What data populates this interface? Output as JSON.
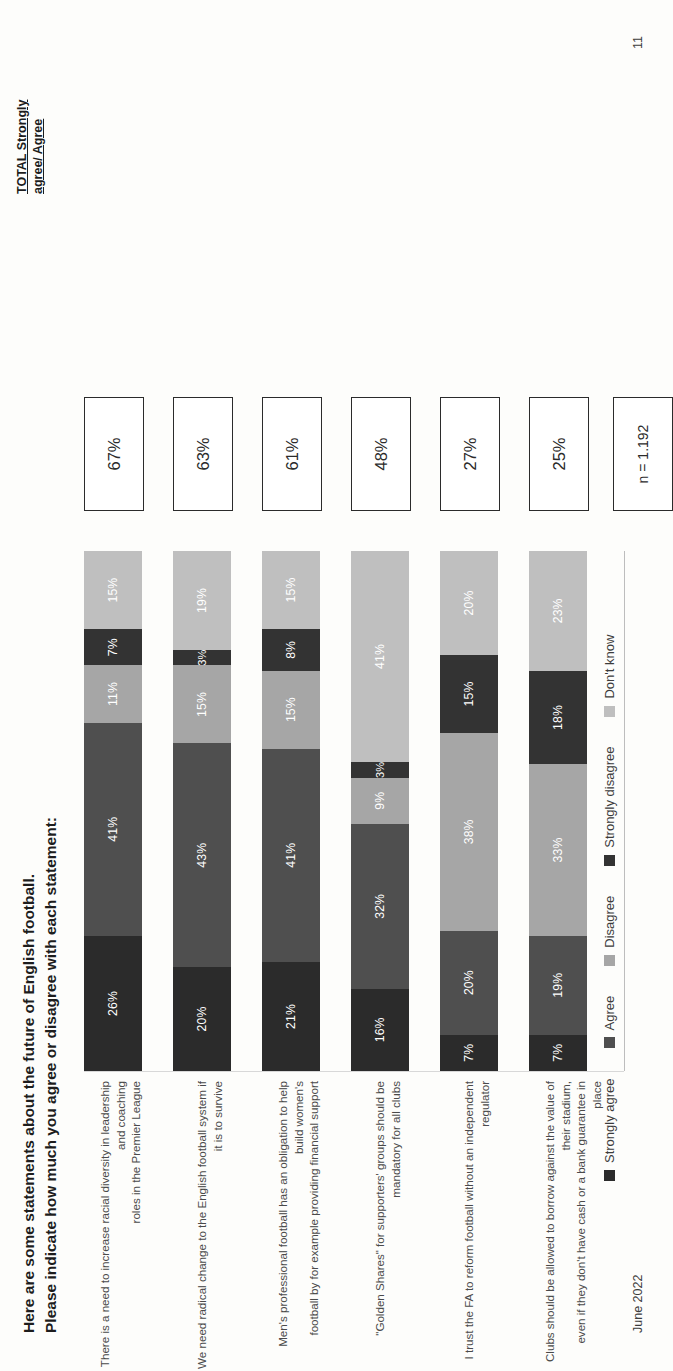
{
  "title": {
    "line1": "Here are some statements about the future of English football.",
    "line2": "Please indicate how much you agree or disagree with each statement:"
  },
  "total_header": {
    "line1": "TOTAL Strongly",
    "line2": "agree/ Agree"
  },
  "sample": {
    "label": "n = 1.192"
  },
  "footer": {
    "date": "June 2022",
    "page": "11"
  },
  "colors": {
    "strongly_agree": "#2b2b2b",
    "agree": "#4f4f4f",
    "disagree": "#a6a6a6",
    "strongly_disagree": "#333333",
    "dont_know": "#bfbfbf",
    "box_border": "#2b2b2b"
  },
  "legend": {
    "items": [
      {
        "label": "Strongly agree",
        "color": "#2b2b2b"
      },
      {
        "label": "Agree",
        "color": "#4f4f4f"
      },
      {
        "label": "Disagree",
        "color": "#a6a6a6"
      },
      {
        "label": "Strongly disagree",
        "color": "#333333"
      },
      {
        "label": "Don't know",
        "color": "#bfbfbf"
      }
    ]
  },
  "chart_data": {
    "type": "bar",
    "subtype": "stacked-horizontal-100",
    "title": "Here are some statements about the future of English football. Please indicate how much you agree or disagree with each statement:",
    "xlabel": "",
    "ylabel": "",
    "xlim": [
      0,
      100
    ],
    "grid": false,
    "legend_position": "bottom",
    "value_suffix": "%",
    "categories": [
      "There is a need to increase racial diversity in leadership and coaching roles in the Premier League",
      "We need radical change to the English football system if it is to survive",
      "Men's professional football has an obligation to help build women's football by for example providing financial support",
      "\"Golden Shares\" for supporters' groups should be mandatory for all clubs",
      "I trust the FA to reform football without an independent regulator",
      "Clubs should be allowed to borrow against the value of their stadium, even if they don't have cash or a bank guarantee in place"
    ],
    "category_lines": [
      [
        "There is a need to increase racial diversity in leadership and coaching",
        "roles in the Premier League"
      ],
      [
        "We need radical change to the English football system if it is to survive",
        ""
      ],
      [
        "Men's professional football has an obligation to help build women's",
        "football by for example providing financial support"
      ],
      [
        "\"Golden Shares\" for supporters' groups should be mandatory for all clubs",
        ""
      ],
      [
        "I trust the FA to reform football without an independent regulator",
        ""
      ],
      [
        "Clubs should be allowed to borrow against the value of their stadium,",
        "even if they don't have cash or a bank guarantee in place"
      ]
    ],
    "series": [
      {
        "name": "Strongly agree",
        "color": "#2b2b2b",
        "values": [
          26,
          20,
          21,
          16,
          7,
          7
        ]
      },
      {
        "name": "Agree",
        "color": "#4f4f4f",
        "values": [
          41,
          43,
          41,
          32,
          20,
          19
        ]
      },
      {
        "name": "Disagree",
        "color": "#a6a6a6",
        "values": [
          11,
          15,
          15,
          9,
          38,
          33
        ]
      },
      {
        "name": "Strongly disagree",
        "color": "#333333",
        "values": [
          7,
          3,
          8,
          3,
          15,
          18
        ]
      },
      {
        "name": "Don't know",
        "color": "#bfbfbf",
        "values": [
          15,
          19,
          15,
          41,
          20,
          23
        ]
      }
    ],
    "totals": [
      "67%",
      "63%",
      "61%",
      "48%",
      "27%",
      "25%"
    ],
    "annotations": [
      "n = 1.192"
    ]
  }
}
